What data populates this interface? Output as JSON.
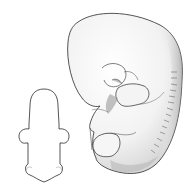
{
  "figure": {
    "views": [
      {
        "name": "dorsal outline view",
        "style": "line drawing"
      },
      {
        "name": "lateral view",
        "style": "shaded drawing"
      }
    ],
    "colors": {
      "background": "#ffffff",
      "line": "#2a2a2a",
      "shade_dark": "#8a8a8a",
      "shade_mid": "#c8c8c8",
      "shade_light": "#ededed"
    }
  }
}
